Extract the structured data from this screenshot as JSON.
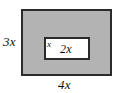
{
  "figure": {
    "type": "geometry-diagram",
    "background_color": "#ffffff"
  },
  "outer_rectangle": {
    "name": "outer-rectangle",
    "fill_color": "#b3b3b3",
    "border_color": "#2b2b2b",
    "width_label": "4x",
    "height_label": "3x"
  },
  "inner_rectangle": {
    "name": "inner-rectangle",
    "fill_color": "#ffffff",
    "border_color": "#2b2b2b",
    "width_label": "2x",
    "height_label": "x"
  },
  "labels": {
    "outer_height": "3x",
    "outer_width": "4x",
    "inner_height": "x",
    "inner_width": "2x"
  }
}
